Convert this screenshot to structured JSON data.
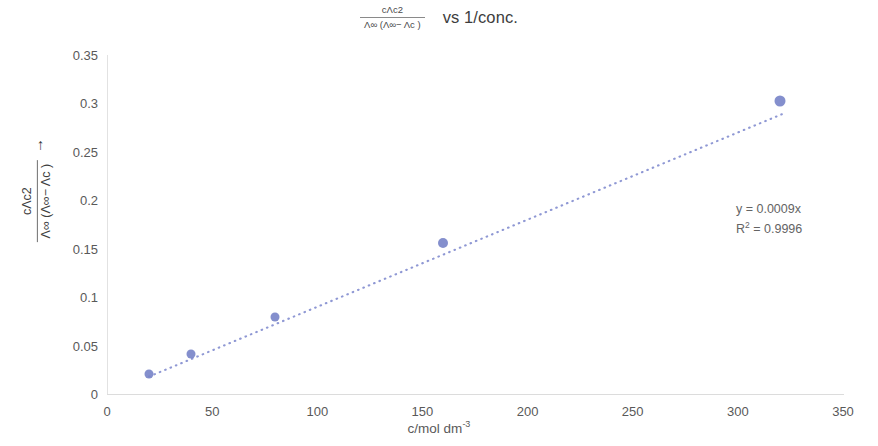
{
  "title": {
    "fraction_numerator": "cΛc2",
    "fraction_denominator": "Λ∞ (Λ∞− Λc )",
    "suffix": "vs 1/conc."
  },
  "y_axis": {
    "title_numerator": "cΛc2",
    "title_denominator": "Λ∞ (Λ∞− Λc )",
    "title_arrow": "→",
    "ticks": [
      "0",
      "0.05",
      "0.1",
      "0.15",
      "0.2",
      "0.25",
      "0.3",
      "0.35"
    ]
  },
  "x_axis": {
    "title_main": "c/mol dm",
    "title_sup": "-3",
    "ticks": [
      "0",
      "50",
      "100",
      "150",
      "200",
      "250",
      "300",
      "350"
    ]
  },
  "annotation": {
    "equation": "y = 0.0009x",
    "r_squared_prefix": "R",
    "r_squared_sup": "2",
    "r_squared_value": " = 0.9996"
  },
  "colors": {
    "marker": "#7a85c9",
    "trendline": "#8f98d4",
    "axis": "#e0e0e0",
    "tick_text": "#595959"
  },
  "chart_data": {
    "type": "scatter",
    "xlabel": "c/mol dm-3",
    "ylabel": "cΛc2 / Λ∞ (Λ∞− Λc ) →",
    "xlim": [
      0,
      350
    ],
    "ylim": [
      0,
      0.35
    ],
    "xticks": [
      0,
      50,
      100,
      150,
      200,
      250,
      300,
      350
    ],
    "yticks": [
      0,
      0.05,
      0.1,
      0.15,
      0.2,
      0.25,
      0.3,
      0.35
    ],
    "grid": false,
    "legend": false,
    "x": [
      20,
      40,
      80,
      160,
      320
    ],
    "y": [
      0.021,
      0.041,
      0.08,
      0.156,
      0.302
    ],
    "marker_sizes": [
      9,
      9,
      9,
      10,
      11
    ],
    "series": [
      {
        "name": "cΛc2 / Λ∞(Λ∞−Λc)",
        "x": [
          20,
          40,
          80,
          160,
          320
        ],
        "values": [
          0.021,
          0.041,
          0.08,
          0.156,
          0.302
        ]
      }
    ],
    "trendline": {
      "type": "linear",
      "slope": 0.0009,
      "intercept": 0,
      "style": "dotted",
      "equation": "y = 0.0009x",
      "r_squared": 0.9996,
      "x_start": 20,
      "x_end": 322
    }
  }
}
